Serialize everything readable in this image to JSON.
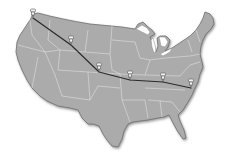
{
  "map": {
    "title": "United States route map",
    "land_color": "#ababab",
    "border_color": "#6e6e6e",
    "state_line_color": "#e6e6e6",
    "route_color": "#2a2a2a",
    "pin_color": "#f2f2f2",
    "pin_outline": "#555555"
  },
  "route": {
    "stops": [
      {
        "id": 1,
        "region": "pacific-northwest",
        "x": 33,
        "y": 13
      },
      {
        "id": 2,
        "region": "mountain-west",
        "x": 71,
        "y": 41
      },
      {
        "id": 3,
        "region": "central-plains",
        "x": 99,
        "y": 69
      },
      {
        "id": 4,
        "region": "mid-south",
        "x": 130,
        "y": 76
      },
      {
        "id": 5,
        "region": "southeast",
        "x": 163,
        "y": 78
      },
      {
        "id": 6,
        "region": "atlantic-coast",
        "x": 191,
        "y": 84
      }
    ]
  }
}
